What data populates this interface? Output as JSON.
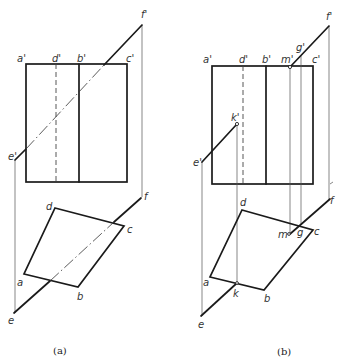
{
  "figure": {
    "panels": [
      {
        "caption": "(a)",
        "labels": {
          "a1": "a'",
          "d1": "d'",
          "b1": "b'",
          "c1": "c'",
          "e1": "e'",
          "f1": "f'",
          "a": "a",
          "b": "b",
          "c": "c",
          "d": "d",
          "e": "e",
          "f": "f"
        }
      },
      {
        "caption": "(b)",
        "labels": {
          "a1": "a'",
          "d1": "d'",
          "b1": "b'",
          "m1": "m'",
          "g1": "g'",
          "c1": "c'",
          "e1": "e'",
          "f1": "f'",
          "k1": "k'",
          "a": "a",
          "b": "b",
          "c": "c",
          "d": "d",
          "e": "e",
          "f": "f",
          "k": "k",
          "m": "m",
          "g": "g"
        }
      }
    ]
  }
}
